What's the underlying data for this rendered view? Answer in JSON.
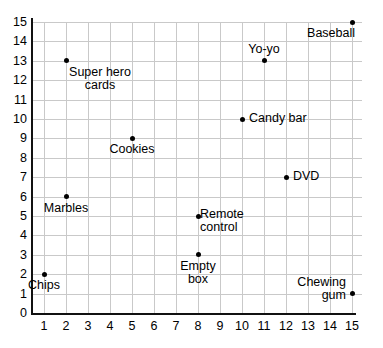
{
  "chart_data": {
    "type": "scatter",
    "title": "",
    "xlabel": "",
    "ylabel": "",
    "xlim": [
      0,
      15
    ],
    "ylim": [
      0,
      15
    ],
    "grid": true,
    "legend": "none",
    "x_ticks": [
      "1",
      "2",
      "3",
      "4",
      "5",
      "6",
      "7",
      "8",
      "9",
      "10",
      "11",
      "12",
      "13",
      "14",
      "15"
    ],
    "y_ticks": [
      "0",
      "1",
      "2",
      "3",
      "4",
      "5",
      "6",
      "7",
      "8",
      "9",
      "10",
      "11",
      "12",
      "13",
      "14",
      "15"
    ],
    "points": [
      {
        "label": "Chips",
        "x": 1,
        "y": 2,
        "label_lines": [
          "Chips"
        ],
        "placement": "below-center"
      },
      {
        "label": "Marbles",
        "x": 2,
        "y": 6,
        "label_lines": [
          "Marbles"
        ],
        "placement": "below-center"
      },
      {
        "label": "Super hero cards",
        "x": 2,
        "y": 13,
        "label_lines": [
          "Super hero",
          "cards"
        ],
        "placement": "below-right"
      },
      {
        "label": "Cookies",
        "x": 5,
        "y": 9,
        "label_lines": [
          "Cookies"
        ],
        "placement": "below-center"
      },
      {
        "label": "Empty box",
        "x": 8,
        "y": 3,
        "label_lines": [
          "Empty",
          "box"
        ],
        "placement": "below-center"
      },
      {
        "label": "Remote control",
        "x": 8,
        "y": 5,
        "label_lines": [
          "Remote",
          "control"
        ],
        "placement": "above-right"
      },
      {
        "label": "Candy bar",
        "x": 10,
        "y": 10,
        "label_lines": [
          "Candy bar"
        ],
        "placement": "right"
      },
      {
        "label": "Yo-yo",
        "x": 11,
        "y": 13,
        "label_lines": [
          "Yo-yo"
        ],
        "placement": "above-center"
      },
      {
        "label": "DVD",
        "x": 12,
        "y": 7,
        "label_lines": [
          "DVD"
        ],
        "placement": "right"
      },
      {
        "label": "Baseball",
        "x": 15,
        "y": 15,
        "label_lines": [
          "Baseball"
        ],
        "placement": "below-left"
      },
      {
        "label": "Chewing gum",
        "x": 15,
        "y": 1,
        "label_lines": [
          "Chewing",
          "gum"
        ],
        "placement": "left"
      }
    ]
  },
  "colors": {
    "marker": "#000000",
    "grid": "#c9c9c9",
    "axis": "#111111",
    "background": "#ffffff",
    "text": "#000000"
  }
}
